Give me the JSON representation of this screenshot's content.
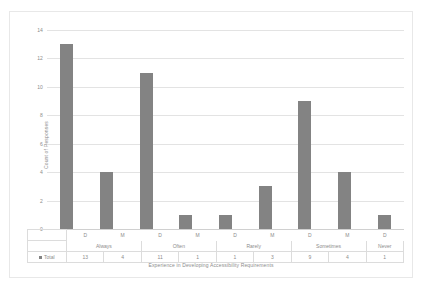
{
  "chart_data": {
    "type": "bar",
    "title": "",
    "xlabel": "Experience in Developing Accessibility Requirements",
    "ylabel": "Count of Responses",
    "ylim": [
      0,
      14
    ],
    "ytick_labels": [
      "14",
      "12",
      "10",
      "8",
      "6",
      "4",
      "2",
      "0"
    ],
    "ytick_values": [
      14,
      12,
      10,
      8,
      6,
      4,
      2,
      0
    ],
    "grid": true,
    "legend_position": "table-row-header",
    "series": [
      {
        "name": "Total",
        "values": [
          13,
          4,
          11,
          1,
          1,
          3,
          9,
          4,
          1
        ]
      }
    ],
    "categories": [
      "D",
      "M",
      "D",
      "M",
      "D",
      "M",
      "D",
      "M",
      "D"
    ],
    "group_labels": [
      {
        "label": "Always",
        "span": 2
      },
      {
        "label": "Often",
        "span": 2
      },
      {
        "label": "Rarely",
        "span": 2
      },
      {
        "label": "Sometimes",
        "span": 2
      },
      {
        "label": "Never",
        "span": 1
      }
    ],
    "bar_color": "#838383",
    "grid_color": "#e3e3e3",
    "text_color": "#8c8c8c"
  },
  "table": {
    "legend_label": "Total",
    "row_values": [
      "13",
      "4",
      "11",
      "1",
      "1",
      "3",
      "9",
      "4",
      "1"
    ]
  }
}
